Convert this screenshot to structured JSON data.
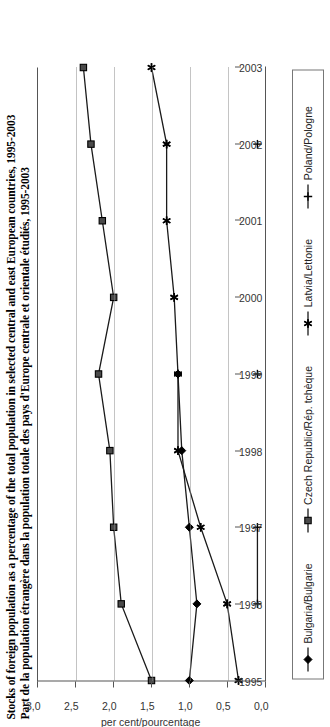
{
  "title": {
    "line_en": "Stocks of foreign population as a percentage of the total population in selected central and east European countries, 1995-2003",
    "line_fr": "Part de la population étrangère dans la population totale des pays d'Europe centrale et orientale étudiés, 1995-2003"
  },
  "axis": {
    "y_label": "per cent/pourcentage",
    "y_ticks": [
      "0,0",
      "0,5",
      "1,0",
      "1,5",
      "2,0",
      "2,5",
      "3,0"
    ],
    "x_ticks": [
      "1995",
      "1996",
      "1997",
      "1998",
      "1999",
      "2000",
      "2001",
      "2002",
      "2003"
    ]
  },
  "legend": {
    "items": [
      {
        "label": "Bulgaria/Bulgarie",
        "marker": "diamond-marker",
        "color": "#000000"
      },
      {
        "label": "Czech Republic/Rép. tchèque",
        "marker": "square-marker",
        "color": "#000000"
      },
      {
        "label": "Latvia/Lettonie",
        "marker": "asterisk-marker",
        "color": "#000000"
      },
      {
        "label": "Poland/Pologne",
        "marker": "plus-marker",
        "color": "#000000"
      }
    ]
  },
  "chart_data": {
    "type": "line",
    "title": "Stocks of foreign population as a percentage of the total population in selected central and east European countries, 1995-2003",
    "subtitle": "Part de la population étrangère dans la population totale des pays d'Europe centrale et orientale étudiés, 1995-2003",
    "xlabel": "",
    "ylabel": "per cent/pourcentage",
    "x": [
      1995,
      1996,
      1997,
      1998,
      1999,
      2000,
      2001,
      2002,
      2003
    ],
    "ylim": [
      0.0,
      3.0
    ],
    "xlim": [
      1995,
      2003
    ],
    "grid": "vertical-dotted-at-value-ticks",
    "legend_position": "bottom",
    "series": [
      {
        "name": "Bulgaria/Bulgarie",
        "marker": "diamond",
        "values": [
          1.0,
          0.9,
          1.0,
          1.1,
          1.15,
          null,
          null,
          null,
          null
        ]
      },
      {
        "name": "Czech Republic/Rép. tchèque",
        "marker": "square",
        "values": [
          1.5,
          1.9,
          2.0,
          2.05,
          2.2,
          2.0,
          2.15,
          2.3,
          2.4
        ]
      },
      {
        "name": "Latvia/Lettonie",
        "marker": "asterisk",
        "values": [
          0.35,
          0.5,
          0.85,
          1.15,
          1.15,
          1.2,
          1.3,
          1.3,
          1.5
        ]
      },
      {
        "name": "Poland/Pologne",
        "marker": "plus",
        "values": [
          null,
          0.1,
          0.1,
          null,
          0.1,
          null,
          null,
          0.1,
          null
        ]
      }
    ]
  }
}
